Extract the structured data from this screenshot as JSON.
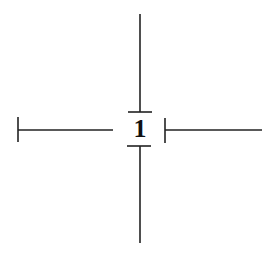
{
  "diagram": {
    "center_label": "1",
    "stroke_color": "#222222",
    "background": "#ffffff",
    "arms": [
      {
        "direction": "up",
        "end_cap": "open"
      },
      {
        "direction": "down",
        "end_cap": "open"
      },
      {
        "direction": "left",
        "end_cap": "bar"
      },
      {
        "direction": "right",
        "end_cap": "bar"
      }
    ]
  }
}
